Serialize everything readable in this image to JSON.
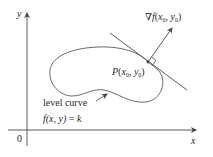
{
  "figure": {
    "type": "gradient-perpendicular-to-level-curve",
    "axes": {
      "x_label": "x",
      "y_label": "y",
      "origin_label": "0"
    },
    "gradient_label": {
      "nabla": "∇",
      "f": "f",
      "open": "(",
      "x": "x",
      "sub0a": "0",
      "comma": ", ",
      "y": "y",
      "sub0b": "0",
      "close": ")"
    },
    "point_label": {
      "P": "P",
      "open": "(",
      "x": "x",
      "sub0a": "0",
      "comma": ", ",
      "y": "y",
      "sub0b": "0",
      "close": ")"
    },
    "level_curve_label": "level curve",
    "equation_label": {
      "f": "f",
      "args": "(x, y)",
      "eq": " = ",
      "k": "k"
    },
    "colors": {
      "line": "#4a4a4a",
      "text": "#2a2a2a",
      "background": "#ffffff"
    }
  }
}
